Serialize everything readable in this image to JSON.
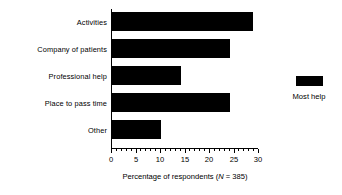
{
  "chart_data": {
    "type": "bar",
    "orientation": "horizontal",
    "title": "",
    "categories": [
      "Activities",
      "Company of patients",
      "Professional help",
      "Place to pass time",
      "Other"
    ],
    "values": [
      28.7,
      24,
      14,
      24,
      10
    ],
    "series": [
      {
        "name": "Most help",
        "color": "#000000",
        "values": [
          28.7,
          24,
          14,
          24,
          10
        ]
      }
    ],
    "xlabel_prefix": "Percentage of respondents (",
    "xlabel_italic": "N",
    "xlabel_suffix": " = 385)",
    "xlabel_full": "Percentage of respondents (N = 385)",
    "ylabel": "",
    "xlim": [
      0,
      30
    ],
    "xticks": [
      0,
      5,
      10,
      15,
      20,
      25,
      30
    ],
    "xtick_labels": [
      "0",
      "5",
      "10",
      "15",
      "20",
      "25",
      "30"
    ],
    "minor_tick_step": 1,
    "grid": false,
    "legend": {
      "position": "right",
      "entries": [
        {
          "label": "Most help",
          "color": "#000000"
        }
      ]
    },
    "bar_color": "#000000",
    "background_color": "#ffffff",
    "axis_color": "#000000"
  }
}
